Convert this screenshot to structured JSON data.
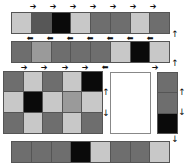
{
  "colors": {
    "light": "#c8c8c8",
    "mid": "#6e6e6e",
    "dark": "#575757",
    "black": "#0a0a0a",
    "midlight": "#9a9a9a",
    "white": "#ffffff"
  },
  "arrows": {
    "right": "➔",
    "left": "⬅",
    "up": "↑",
    "down": "↓"
  },
  "strip_top": {
    "cells": [
      "light",
      "dark",
      "black",
      "light",
      "mid",
      "mid",
      "light",
      "mid"
    ],
    "arrows_above": [
      "right",
      "right",
      "right",
      "right",
      "right",
      "right",
      "right"
    ],
    "arrows_below": [
      "left",
      "left",
      "left",
      "left",
      "left",
      "left",
      "left"
    ]
  },
  "strip_second": {
    "cells": [
      "mid",
      "midlight",
      "mid",
      "mid",
      "mid",
      "light",
      "black",
      "light"
    ],
    "arrows_below": [
      "right",
      "right",
      "right",
      "right",
      "left",
      "right"
    ]
  },
  "side_arrows_top": [
    "up",
    "up"
  ],
  "grid": {
    "rows": [
      [
        "mid",
        "light",
        "mid",
        "light",
        "black"
      ],
      [
        "light",
        "black",
        "light",
        "midlight",
        "light"
      ],
      [
        "mid",
        "light",
        "mid",
        "light",
        "mid"
      ]
    ],
    "side_arrows": [
      "up",
      "down"
    ]
  },
  "blank_panel": {},
  "column": {
    "cells": [
      "mid",
      "mid",
      "black"
    ],
    "side_arrows": [
      "up",
      "down"
    ],
    "below_arrow": "down"
  },
  "strip_bottom": {
    "cells": [
      "mid",
      "mid",
      "mid",
      "black",
      "light",
      "mid",
      "mid",
      "light"
    ]
  }
}
